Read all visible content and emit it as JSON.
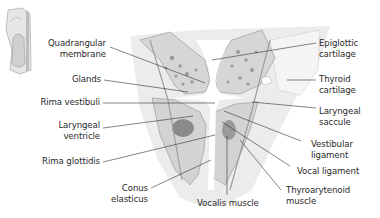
{
  "diagram": {
    "colors": {
      "tissue": "#d9d9d9",
      "tissue_dark": "#a9a9a9",
      "gland": "#8f8f8f",
      "muscle_core": "#7d7d7d",
      "lumen": "#ffffff",
      "leader": "#333333",
      "text": "#2a2a2a"
    },
    "labels_left": [
      {
        "id": "quadrangular-membrane",
        "line1": "Quadrangular",
        "line2": "membrane"
      },
      {
        "id": "glands",
        "line1": "Glands",
        "line2": ""
      },
      {
        "id": "rima-vestibuli",
        "line1": "Rima vestibuli",
        "line2": ""
      },
      {
        "id": "laryngeal-ventricle",
        "line1": "Laryngeal",
        "line2": "ventricle"
      },
      {
        "id": "rima-glottidis",
        "line1": "Rima glottidis",
        "line2": ""
      },
      {
        "id": "conus-elasticus",
        "line1": "Conus",
        "line2": "elasticus"
      }
    ],
    "labels_right": [
      {
        "id": "epiglottic-cartilage",
        "line1": "Epiglottic",
        "line2": "cartilage"
      },
      {
        "id": "thyroid-cartilage",
        "line1": "Thyroid",
        "line2": "cartilage"
      },
      {
        "id": "laryngeal-saccule",
        "line1": "Laryngeal",
        "line2": "saccule"
      },
      {
        "id": "vestibular-ligament",
        "line1": "Vestibular",
        "line2": "ligament"
      },
      {
        "id": "vocal-ligament",
        "line1": "Vocal ligament",
        "line2": ""
      },
      {
        "id": "thyroarytenoid-muscle",
        "line1": "Thyroarytenoid",
        "line2": "muscle"
      }
    ],
    "labels_bottom": [
      {
        "id": "vocalis-muscle",
        "line1": "Vocalis muscle",
        "line2": ""
      }
    ],
    "inset": {
      "description": "Larynx overview thumbnail"
    }
  }
}
